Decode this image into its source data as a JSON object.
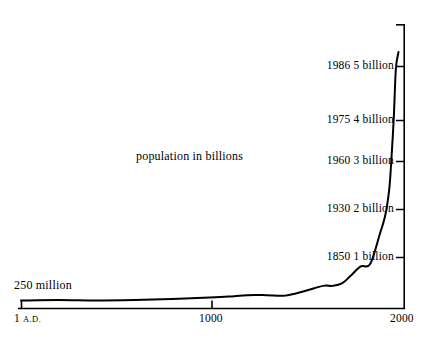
{
  "figure": {
    "background_color": "#ffffff",
    "ink_color": "#000000",
    "series_label": "population in billions",
    "start_label": "250 million"
  },
  "axis": {
    "x_ticks": [
      {
        "label_main": "1",
        "label_suffix": "A.D.",
        "value": 1
      },
      {
        "label_main": "1000",
        "label_suffix": "",
        "value": 1000
      },
      {
        "label_main": "2000",
        "label_suffix": "",
        "value": 2000
      }
    ],
    "y_annotations": [
      {
        "year": "1850",
        "amount": "1 billion",
        "value": 1
      },
      {
        "year": "1930",
        "amount": "2 billion",
        "value": 2
      },
      {
        "year": "1960",
        "amount": "3 billion",
        "value": 3
      },
      {
        "year": "1975",
        "amount": "4 billion",
        "value": 4
      },
      {
        "year": "1986",
        "amount": "5 billion",
        "value": 5
      }
    ]
  },
  "chart_data": {
    "type": "line",
    "title": "",
    "subtitle": "",
    "xlabel": "",
    "ylabel": "population in billions",
    "xlim": [
      1,
      2000
    ],
    "ylim": [
      0,
      5.4
    ],
    "grid": false,
    "legend": "none",
    "annotations": [
      {
        "text": "250 million",
        "x": 1,
        "y": 0.25
      },
      {
        "text": "population in billions",
        "x": 950,
        "y": 3.0
      },
      {
        "text": "1850 1 billion",
        "x": 1850,
        "y": 1
      },
      {
        "text": "1930 2 billion",
        "x": 1930,
        "y": 2
      },
      {
        "text": "1960 3 billion",
        "x": 1960,
        "y": 3
      },
      {
        "text": "1975 4 billion",
        "x": 1975,
        "y": 4
      },
      {
        "text": "1986 5 billion",
        "x": 1986,
        "y": 5
      }
    ],
    "x": [
      1,
      200,
      400,
      600,
      800,
      1000,
      1100,
      1200,
      1300,
      1400,
      1500,
      1600,
      1650,
      1700,
      1750,
      1800,
      1850,
      1900,
      1930,
      1950,
      1960,
      1975,
      1986,
      2000
    ],
    "y": [
      0.25,
      0.26,
      0.25,
      0.26,
      0.28,
      0.31,
      0.33,
      0.36,
      0.36,
      0.35,
      0.44,
      0.55,
      0.55,
      0.6,
      0.77,
      0.95,
      1.0,
      1.6,
      2.0,
      2.5,
      3.0,
      4.0,
      5.0,
      5.35
    ],
    "series": [
      {
        "name": "world population",
        "values": [
          0.25,
          0.26,
          0.25,
          0.26,
          0.28,
          0.31,
          0.33,
          0.36,
          0.36,
          0.35,
          0.44,
          0.55,
          0.55,
          0.6,
          0.77,
          0.95,
          1.0,
          1.6,
          2.0,
          2.5,
          3.0,
          4.0,
          5.0,
          5.35
        ]
      }
    ]
  }
}
